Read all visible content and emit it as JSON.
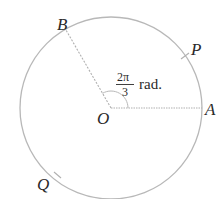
{
  "diagram": {
    "type": "circle-radian-angle",
    "center_label": "O",
    "points": {
      "A": "A",
      "B": "B",
      "P": "P",
      "Q": "Q"
    },
    "angle": {
      "numerator": "2π",
      "denominator": "3",
      "unit": "rad."
    },
    "colors": {
      "circle": "#b8b8b8",
      "radius": "#b0b0b0",
      "text": "#2a2a2a"
    }
  }
}
